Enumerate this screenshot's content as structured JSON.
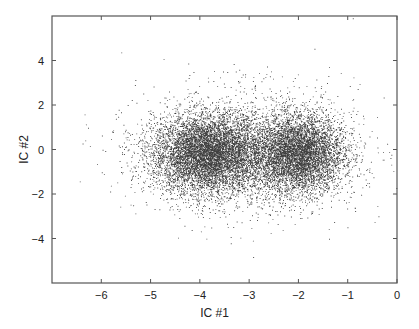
{
  "chart_data": {
    "type": "scatter",
    "title": "",
    "xlabel": "IC #1",
    "ylabel": "IC #2",
    "xlim": [
      -7,
      0
    ],
    "ylim": [
      -6,
      6
    ],
    "xticks": [
      -6,
      -5,
      -4,
      -3,
      -2,
      -1,
      0
    ],
    "xtick_labels": [
      "−6",
      "−5",
      "−4",
      "−3",
      "−2",
      "−1",
      "0"
    ],
    "yticks": [
      -4,
      -2,
      0,
      2,
      4
    ],
    "ytick_labels": [
      "−4",
      "−2",
      "0",
      "2",
      "4"
    ],
    "grid": false,
    "legend": null,
    "marker": "point",
    "marker_color": "#000000",
    "series": [
      {
        "name": "cluster-left",
        "center": [
          -3.85,
          -0.2
        ],
        "std": [
          0.55,
          0.85
        ],
        "approx_count": 11000
      },
      {
        "name": "cluster-right",
        "center": [
          -2.0,
          -0.2
        ],
        "std": [
          0.45,
          0.85
        ],
        "approx_count": 9000
      },
      {
        "name": "diffuse-halo",
        "center": [
          -3.0,
          -0.1
        ],
        "std": [
          1.1,
          1.4
        ],
        "approx_count": 2500
      }
    ],
    "note": "Two dense overlapping clusters around IC#1 ≈ −3.85 and −2.0, IC#2 ≈ −0.2; sparse outliers span IC#1 −7..−0.5 and IC#2 −5..5"
  },
  "layout": {
    "plot_box": {
      "left": 52,
      "top": 16,
      "right": 397,
      "bottom": 283
    },
    "colors": {
      "axis": "#555555",
      "point": "#000000",
      "background": "#ffffff"
    }
  }
}
